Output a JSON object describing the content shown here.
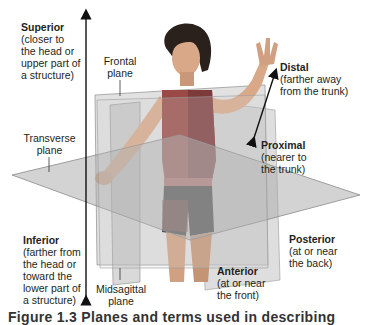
{
  "labels": {
    "superior": {
      "title": "Superior",
      "desc": [
        "(closer to",
        "the head or",
        "upper part of",
        "a structure)"
      ]
    },
    "inferior": {
      "title": "Inferior",
      "desc": [
        "(farther from",
        "the head or",
        "toward the",
        "lower part of",
        "a structure)"
      ]
    },
    "distal": {
      "title": "Distal",
      "desc": [
        "(farther away",
        "from the trunk)"
      ]
    },
    "proximal": {
      "title": "Proximal",
      "desc": [
        "(nearer to",
        "the trunk)"
      ]
    },
    "posterior": {
      "title": "Posterior",
      "desc": [
        "(at or near",
        "the back)"
      ]
    },
    "anterior": {
      "title": "Anterior",
      "desc": [
        "(at or near",
        "the front)"
      ]
    }
  },
  "planes": {
    "frontal": [
      "Frontal",
      "plane"
    ],
    "transverse": [
      "Transverse",
      "plane"
    ],
    "midsagittal": [
      "Midsagittal",
      "plane"
    ]
  },
  "caption": "Figure 1.3 Planes and terms used in describing",
  "colors": {
    "plane_fill": "#b9b9b9",
    "plane_edge": "#8a8a8a",
    "shirt_front": "#9a4a45",
    "shirt_side": "#7d3a3a",
    "skin": "#d9a888",
    "hair": "#2a211d",
    "shorts": "#2b2626",
    "text": "#231f20"
  }
}
